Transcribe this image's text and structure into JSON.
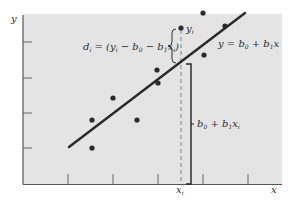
{
  "chart_data": {
    "type": "scatter",
    "title": "",
    "xlabel": "x",
    "ylabel": "y",
    "grid": false,
    "colors": {
      "panel": "#e4e4e4",
      "axis": "#555555",
      "line": "#2a2a2a",
      "points": "#2a2a2a",
      "text": "#2b2b2b"
    },
    "x_ticks": 5,
    "y_ticks": 4,
    "points_px": [
      {
        "x": 92,
        "y": 120
      },
      {
        "x": 92,
        "y": 148
      },
      {
        "x": 113,
        "y": 98
      },
      {
        "x": 137,
        "y": 120
      },
      {
        "x": 157,
        "y": 70
      },
      {
        "x": 158,
        "y": 83
      },
      {
        "x": 181,
        "y": 28
      },
      {
        "x": 203,
        "y": 13
      },
      {
        "x": 204,
        "y": 55
      },
      {
        "x": 225,
        "y": 26
      }
    ],
    "regression_line_px": {
      "x1": 69,
      "y1": 147,
      "x2": 245,
      "y2": 13
    },
    "highlight_point_index": 6,
    "annotations": {
      "residual_label": {
        "d": "d",
        "d_sub": "i",
        "eq": " = (y",
        "y_sub": "i",
        "minus_b0": " − b",
        "b0_sub": "0",
        "minus_b1": " − b",
        "b1_sub": "1",
        "x": "x",
        "x_sub": "i",
        "close": ")"
      },
      "point_label": {
        "y": "y",
        "y_sub": "i"
      },
      "line_label": {
        "lhs": "y = b",
        "b0_sub": "0",
        "plus": " + b",
        "b1_sub": "1",
        "x": "x"
      },
      "fitted_label": {
        "b": "b",
        "b0_sub": "0",
        "plus": " + b",
        "b1_sub": "1",
        "x": "x",
        "x_sub": "i"
      },
      "xi_label": {
        "x": "x",
        "x_sub": "i"
      }
    },
    "axis_labels": {
      "x": "x",
      "y": "y"
    }
  }
}
